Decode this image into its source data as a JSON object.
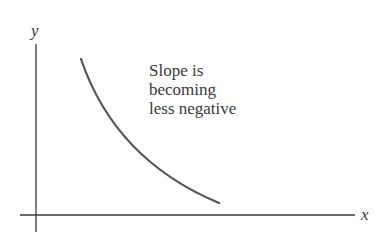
{
  "diagram": {
    "axes": {
      "x_label": "x",
      "y_label": "y"
    },
    "annotation": {
      "lines": [
        "Slope is",
        "becoming",
        "less negative"
      ]
    },
    "curve": {
      "description": "decreasing convex curve",
      "color": "#555555"
    },
    "colors": {
      "axis": "#3a3a3a",
      "text": "#3a3a3a"
    }
  }
}
